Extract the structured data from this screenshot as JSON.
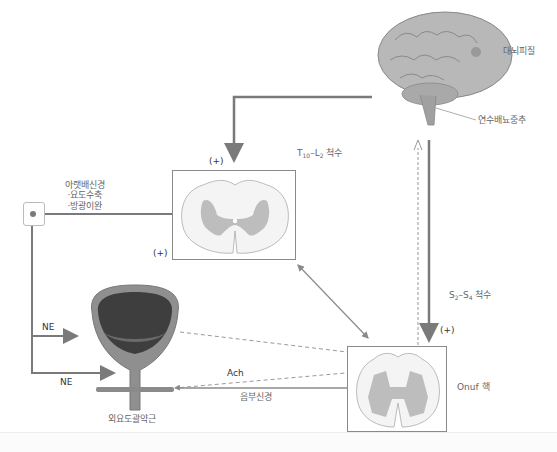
{
  "diagram": {
    "type": "neural-pathway"
  },
  "labels": {
    "cerebral_cortex": "대뇌피질",
    "pontine_micturition_center": "연수배뇨중추",
    "thoracolumbar_cord": {
      "prefix": "T",
      "sub1": "10",
      "mid": "–L",
      "sub2": "2",
      "suffix": " 척수"
    },
    "sacral_cord": {
      "prefix": "S",
      "sub1": "2",
      "mid": "–S",
      "sub2": "4",
      "suffix": " 척수"
    },
    "hypogastric_nerve": {
      "title": "아랫배신경",
      "effects": [
        "·요도수축",
        "·방광이완"
      ]
    },
    "ne_upper": "NE",
    "ne_lower": "NE",
    "ach": "Ach",
    "pudendal_nerve": "음부신경",
    "onuf_nucleus": "Onuf 핵",
    "external_urethral_sphincter": "외요도괄약근",
    "plus_top": "(+)",
    "plus_left": "(+)",
    "plus_right": "(+)"
  },
  "colors": {
    "line": "#7a7a7a",
    "box_border": "#8a8a8a",
    "gray_matter": "#bdbdbd",
    "white_matter": "#f4f4f4",
    "brain": "#b5b5b5",
    "bladder_outer": "#8c8c8c",
    "bladder_inner": "#3e3e3e"
  },
  "caption": ""
}
